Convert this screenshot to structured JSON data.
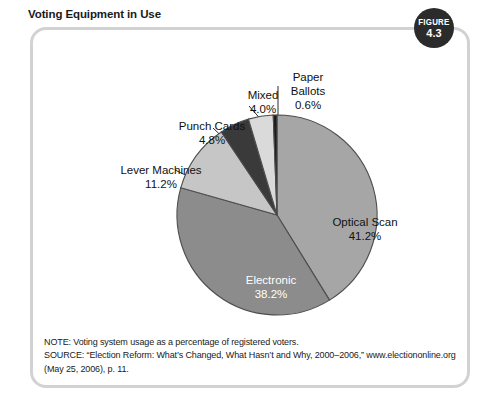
{
  "figure": {
    "title": "Voting Equipment in Use",
    "badge_word": "FIGURE",
    "badge_number": "4.3"
  },
  "chart_data": {
    "type": "pie",
    "title": "Voting Equipment in Use",
    "xlabel": "",
    "ylabel": "",
    "units": "percent of registered voters",
    "start_angle_deg": 0,
    "direction": "clockwise",
    "legend": "none (direct slice labels with leader lines)",
    "grid": false,
    "total": 100.0,
    "categories": [
      "Optical Scan",
      "Electronic",
      "Lever Machines",
      "Punch Cards",
      "Mixed",
      "Paper Ballots"
    ],
    "values": [
      41.2,
      38.2,
      11.2,
      4.8,
      4.0,
      0.6
    ],
    "value_labels": [
      "41.2%",
      "38.2%",
      "11.2%",
      "4.8%",
      "4.0%",
      "0.6%"
    ],
    "slices": [
      {
        "name": "Optical Scan",
        "value": 41.2,
        "value_label": "41.2%",
        "color": "#a6a6a6",
        "label_placement": "inside"
      },
      {
        "name": "Electronic",
        "value": 38.2,
        "value_label": "38.2%",
        "color": "#8c8c8c",
        "label_placement": "inside"
      },
      {
        "name": "Lever Machines",
        "value": 11.2,
        "value_label": "11.2%",
        "color": "#c6c6c6",
        "label_placement": "outside-leader"
      },
      {
        "name": "Punch Cards",
        "value": 4.8,
        "value_label": "4.8%",
        "color": "#3a3a3a",
        "label_placement": "outside-leader"
      },
      {
        "name": "Mixed",
        "value": 4.0,
        "value_label": "4.0%",
        "color": "#dadada",
        "label_placement": "outside-leader"
      },
      {
        "name": "Paper Ballots",
        "value": 0.6,
        "value_label": "0.6%",
        "color": "#1c1c1c",
        "label_placement": "outside-leader"
      }
    ]
  },
  "labels": {
    "optical_scan": {
      "name": "Optical Scan",
      "value": "41.2%"
    },
    "electronic": {
      "name": "Electronic",
      "value": "38.2%"
    },
    "lever_machines": {
      "name": "Lever Machines",
      "value": "11.2%"
    },
    "punch_cards": {
      "name": "Punch Cards",
      "value": "4.8%"
    },
    "mixed": {
      "name": "Mixed",
      "value": "4.0%"
    },
    "paper_ballots": {
      "name": "Paper\nBallots",
      "name_line1": "Paper",
      "name_line2": "Ballots",
      "value": "0.6%"
    }
  },
  "footnotes": {
    "note": "NOTE: Voting system usage as a percentage of registered voters.",
    "source_line1": "SOURCE: “Election Reform: What’s Changed, What Hasn’t and Why, 2000–2006,” www.electiononline.org",
    "source_line2": "(May 25, 2006), p. 11."
  },
  "colors": {
    "frame_border": "#d2d2d2",
    "badge_bg": "#2b2b2b",
    "slice_outline": "#4a4a4a",
    "text": "#111111",
    "inside_label_text": "#ffffff"
  }
}
